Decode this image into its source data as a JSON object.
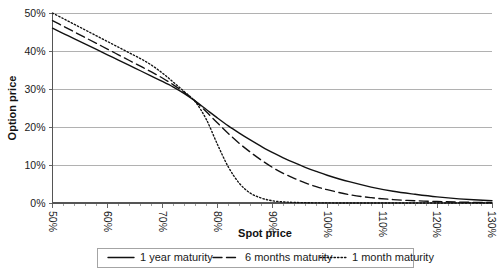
{
  "chart_data": {
    "type": "line",
    "title": "",
    "xlabel": "Spot price",
    "ylabel": "Option price",
    "xlim": [
      50,
      130
    ],
    "ylim": [
      0,
      50
    ],
    "xticks": [
      "50%",
      "60%",
      "70%",
      "80%",
      "90%",
      "100%",
      "110%",
      "120%",
      "130%"
    ],
    "xtick_values": [
      50,
      60,
      70,
      80,
      90,
      100,
      110,
      120,
      130
    ],
    "yticks": [
      "0%",
      "10%",
      "20%",
      "30%",
      "40%",
      "50%"
    ],
    "ytick_values": [
      0,
      10,
      20,
      30,
      40,
      50
    ],
    "grid": "horizontal",
    "legend_position": "bottom",
    "x": [
      50,
      52,
      54,
      56,
      58,
      60,
      62,
      64,
      66,
      68,
      70,
      72,
      74,
      76,
      78,
      80,
      82,
      84,
      86,
      88,
      90,
      92,
      94,
      96,
      98,
      100,
      104,
      108,
      112,
      116,
      120,
      124,
      130
    ],
    "series": [
      {
        "name": "1 year maturity",
        "style": "solid",
        "values": [
          46.0,
          44.6,
          43.2,
          41.8,
          40.4,
          39.0,
          37.6,
          36.2,
          34.8,
          33.4,
          32.0,
          30.5,
          28.8,
          26.8,
          24.6,
          22.4,
          20.3,
          18.4,
          16.6,
          14.9,
          13.3,
          11.9,
          10.6,
          9.4,
          8.3,
          7.3,
          5.6,
          4.2,
          3.1,
          2.3,
          1.6,
          1.1,
          0.6
        ]
      },
      {
        "name": "6 months maturity",
        "style": "dashed",
        "values": [
          48.0,
          46.5,
          45.0,
          43.5,
          42.0,
          40.5,
          39.0,
          37.5,
          36.0,
          34.5,
          32.9,
          31.1,
          29.1,
          26.8,
          24.0,
          21.1,
          18.3,
          15.7,
          13.4,
          11.3,
          9.4,
          7.8,
          6.5,
          5.3,
          4.3,
          3.5,
          2.2,
          1.4,
          0.9,
          0.6,
          0.4,
          0.25,
          0.1
        ]
      },
      {
        "name": "1 month maturity",
        "style": "dotted",
        "values": [
          50.0,
          48.5,
          47.0,
          45.5,
          44.0,
          42.5,
          41.0,
          39.5,
          38.0,
          36.3,
          34.2,
          31.8,
          29.3,
          26.6,
          22.0,
          15.5,
          9.5,
          5.2,
          2.6,
          1.3,
          0.6,
          0.3,
          0.15,
          0.08,
          0.04,
          0.02,
          0.0,
          0.0,
          0.0,
          0.0,
          0.0,
          0.0,
          0.0
        ]
      }
    ]
  },
  "axes": {
    "y_title": "Option price",
    "x_title": "Spot price"
  },
  "legend": {
    "entries": [
      {
        "label": "1 year maturity",
        "style": "solid"
      },
      {
        "label": "6 months maturity",
        "style": "dashed"
      },
      {
        "label": "1 month maturity",
        "style": "dotted"
      }
    ]
  }
}
